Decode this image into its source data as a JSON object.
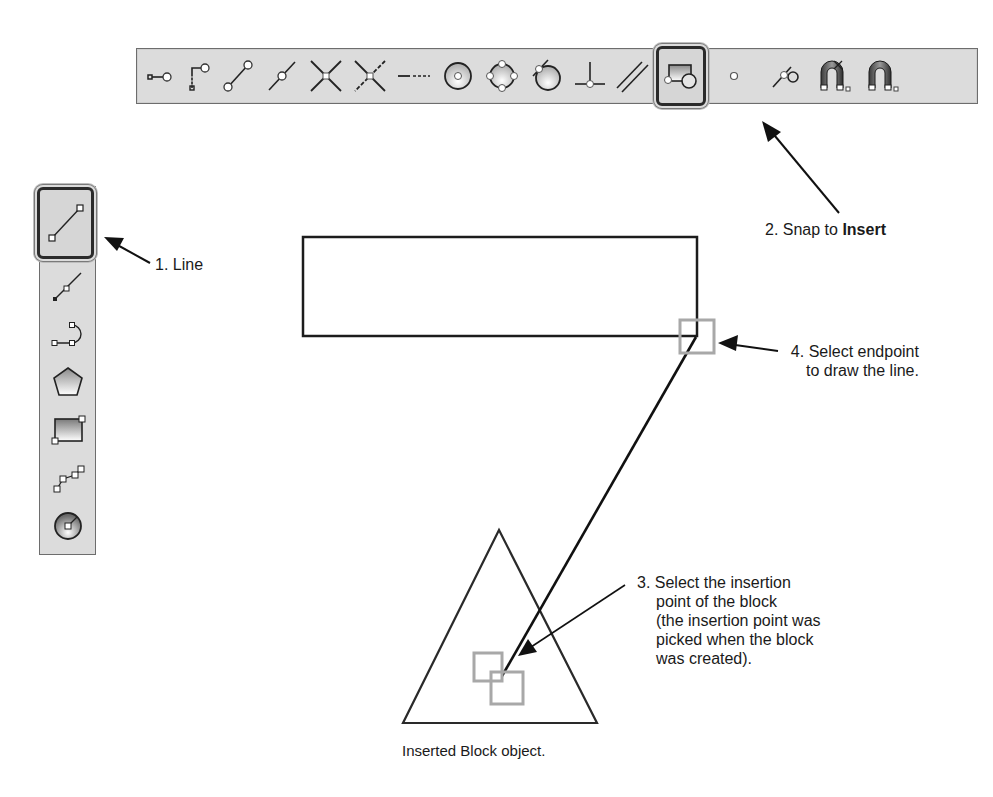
{
  "horizontal_toolbar": {
    "name": "Object Snap toolbar",
    "buttons": [
      {
        "id": "temporary-track-point",
        "icon": "temporary-track-point-icon"
      },
      {
        "id": "snap-from",
        "icon": "snap-from-icon"
      },
      {
        "id": "snap-endpoint",
        "icon": "endpoint-icon"
      },
      {
        "id": "snap-midpoint",
        "icon": "midpoint-icon"
      },
      {
        "id": "snap-intersection",
        "icon": "intersection-icon"
      },
      {
        "id": "snap-apparent-intersection",
        "icon": "apparent-intersection-icon"
      },
      {
        "id": "snap-extension",
        "icon": "extension-icon"
      },
      {
        "id": "snap-center",
        "icon": "center-icon"
      },
      {
        "id": "snap-quadrant",
        "icon": "quadrant-icon"
      },
      {
        "id": "snap-tangent",
        "icon": "tangent-icon"
      },
      {
        "id": "snap-perpendicular",
        "icon": "perpendicular-icon"
      },
      {
        "id": "snap-parallel",
        "icon": "parallel-icon"
      },
      {
        "id": "snap-insert",
        "icon": "insert-icon",
        "selected": true
      },
      {
        "id": "snap-node",
        "icon": "node-icon"
      },
      {
        "id": "snap-nearest",
        "icon": "nearest-icon"
      },
      {
        "id": "snap-none",
        "icon": "snap-none-icon"
      },
      {
        "id": "osnap-settings",
        "icon": "osnap-settings-icon"
      }
    ]
  },
  "vertical_toolbar": {
    "name": "Draw toolbar",
    "buttons": [
      {
        "id": "line",
        "icon": "line-icon",
        "selected": true
      },
      {
        "id": "construction-line",
        "icon": "construction-line-icon"
      },
      {
        "id": "polyline",
        "icon": "polyline-icon"
      },
      {
        "id": "polygon",
        "icon": "polygon-icon"
      },
      {
        "id": "rectangle",
        "icon": "rectangle-icon"
      },
      {
        "id": "spline",
        "icon": "spline-icon"
      },
      {
        "id": "circle",
        "icon": "circle-icon"
      }
    ]
  },
  "annotations": {
    "step1": "1. Line",
    "step2_prefix": "2. Snap to ",
    "step2_bold": "Insert",
    "step3_lines": [
      "3. Select the insertion",
      "point of the block",
      "(the insertion point was",
      "picked when the block",
      "was created)."
    ],
    "step4_lines": [
      "4. Select endpoint",
      "to draw the line."
    ],
    "block_caption": "Inserted Block object."
  },
  "drawing": {
    "rectangle": {
      "x": 303,
      "y": 237,
      "width": 394,
      "height": 99
    },
    "triangle": {
      "apex": [
        499,
        530
      ],
      "base_left": [
        403,
        723
      ],
      "base_right": [
        597,
        723
      ]
    },
    "drawn_line": {
      "from": [
        696,
        337
      ],
      "to": [
        502,
        676
      ]
    },
    "snap_marker_color": "#a8a8a8"
  },
  "colors": {
    "toolbar_bg": "#dcdcdc",
    "toolbar_border": "#6d6d6d",
    "ink": "#1a1a1a"
  }
}
